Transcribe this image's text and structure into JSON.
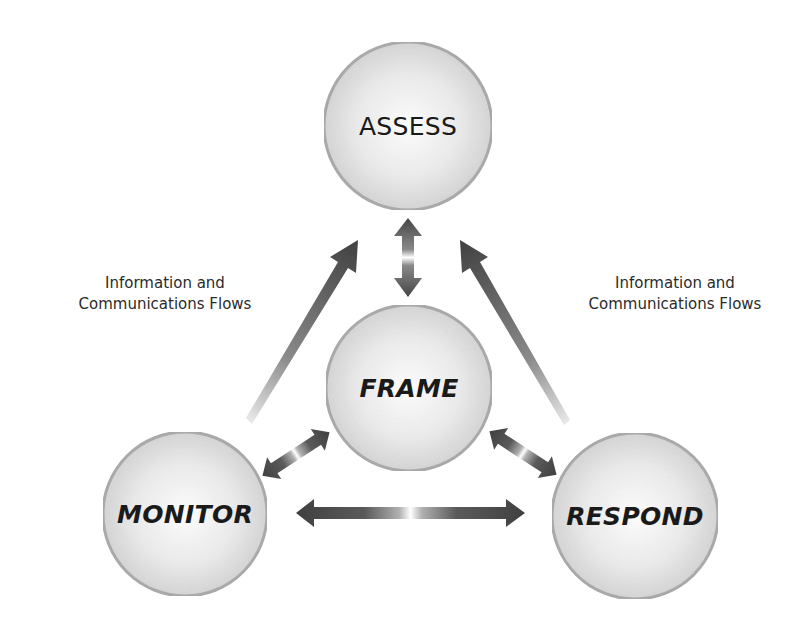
{
  "diagram": {
    "title": "",
    "nodes": [
      {
        "id": "assess",
        "label": "ASSESS",
        "cx": 408,
        "cy": 126,
        "r": 84
      },
      {
        "id": "frame",
        "label": "FRAME",
        "cx": 409,
        "cy": 388,
        "r": 83
      },
      {
        "id": "monitor",
        "label": "MONITOR",
        "cx": 185,
        "cy": 514,
        "r": 82
      },
      {
        "id": "respond",
        "label": "RESPOND",
        "cx": 635,
        "cy": 516,
        "r": 83
      }
    ],
    "edges": [
      {
        "from": "frame",
        "to": "assess",
        "type": "bidirectional"
      },
      {
        "from": "frame",
        "to": "monitor",
        "type": "bidirectional"
      },
      {
        "from": "frame",
        "to": "respond",
        "type": "bidirectional"
      },
      {
        "from": "monitor",
        "to": "respond",
        "type": "bidirectional"
      },
      {
        "from": "monitor",
        "to": "assess",
        "type": "directed-tapered"
      },
      {
        "from": "respond",
        "to": "assess",
        "type": "directed-tapered"
      }
    ],
    "annotations": {
      "left": {
        "line1": "Information and",
        "line2": "Communications Flows"
      },
      "right": {
        "line1": "Information and",
        "line2": "Communications Flows"
      }
    },
    "colors": {
      "background": "#ffffff",
      "circle_fill_center": "#ffffff",
      "circle_fill_edge": "#d6d6d6",
      "circle_stroke": "#a8a8a8",
      "arrow_dark": "#4a4a4a",
      "text": "#1a1a1a"
    }
  }
}
